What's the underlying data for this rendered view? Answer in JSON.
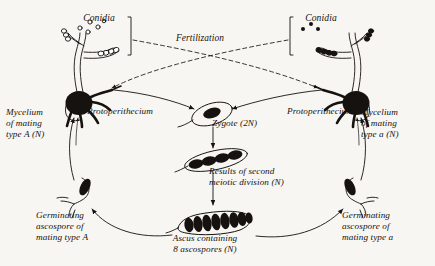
{
  "diagram": {
    "background_color": "#f7f6f2",
    "ink_color": "#15120f"
  },
  "labels": {
    "conidia_left": "Conidia",
    "conidia_right": "Conidia",
    "fertilization": "Fertilization",
    "protoperithecium_left": "Protoperithecium",
    "protoperithecium_right": "Protoperithecium",
    "mycelium_left": "Mycelium\nof mating\ntype A (N)",
    "mycelium_right": "Mycelium\nof mating\ntype a (N)",
    "zygote": "Zygote (2N)",
    "meiosis": "Results of second\nmeiotic division (N)",
    "ascus": "Ascus containing\n8 ascospores (N)",
    "germinating_left": "Germinating\nascospore of\nmating type A",
    "germinating_right": "Germinating\nascospore of\nmating type a"
  },
  "structures": {
    "conidia_left_style": "open-circles",
    "conidia_left_count": 5,
    "conidia_right_style": "filled-dots",
    "conidia_right_count": 3,
    "zygote_nuclei": 1,
    "meiosis_nuclei": 4,
    "ascospores": 8,
    "protoperithecium_trichogyne_arms": 4
  }
}
